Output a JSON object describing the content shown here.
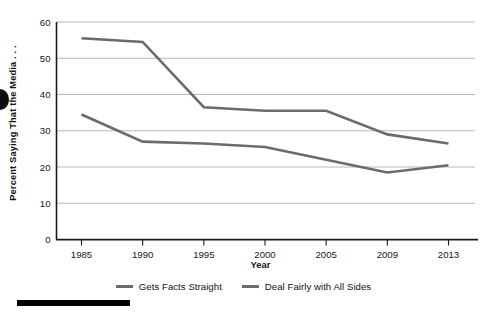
{
  "chart_data": {
    "type": "line",
    "title": "",
    "xlabel": "Year",
    "ylabel": "Percent Saying That the Media . . .",
    "categories": [
      "1985",
      "1990",
      "1995",
      "2000",
      "2005",
      "2009",
      "2013"
    ],
    "ylim": [
      0,
      60
    ],
    "yticks": [
      "0",
      "10",
      "20",
      "30",
      "40",
      "50",
      "60"
    ],
    "ytick_values": [
      0,
      10,
      20,
      30,
      40,
      50,
      60
    ],
    "grid": "horizontal",
    "legend_position": "bottom",
    "series": [
      {
        "name": "Gets Facts Straight",
        "color": "#6b6b6b",
        "values": [
          55.5,
          54.5,
          36.5,
          35.5,
          35.5,
          29.0,
          26.5
        ]
      },
      {
        "name": "Deal Fairly with All Sides",
        "color": "#6b6b6b",
        "values": [
          34.5,
          27.0,
          26.5,
          25.5,
          22.0,
          18.5,
          20.5
        ]
      }
    ]
  },
  "legend": {
    "items": [
      {
        "label": "Gets Facts Straight",
        "swatch": "line-swatch"
      },
      {
        "label": "Deal Fairly with All Sides",
        "swatch": "line-swatch"
      }
    ]
  },
  "axes": {
    "y_title": "Percent Saying That the Media . . .",
    "x_title": "Year"
  },
  "colors": {
    "series_line": "#6b6b6b",
    "grid": "#b0b0b0",
    "axis": "#1a1a1a",
    "text": "#121212",
    "background": "#ffffff"
  }
}
